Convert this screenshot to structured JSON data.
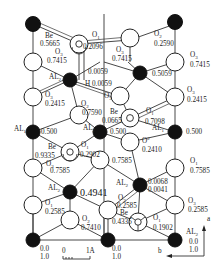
{
  "diagram": {
    "atoms": [
      {
        "id": "al-top-left",
        "type": "Al",
        "label": "",
        "height": "",
        "x": 33,
        "y": 24
      },
      {
        "id": "al-top-right",
        "type": "Al",
        "label": "",
        "height": "",
        "x": 175,
        "y": 24
      },
      {
        "id": "be-top",
        "type": "Be",
        "label": "Be",
        "height": "0.5665",
        "x": 79,
        "y": 44
      },
      {
        "id": "o1-top",
        "type": "O",
        "label": "O",
        "sub": "1",
        "height": "0.2096",
        "x": 79,
        "y": 44
      },
      {
        "id": "o3-top-left",
        "type": "O",
        "label": "O",
        "sub": "3",
        "height": "0.7415",
        "x": 33,
        "y": 62
      },
      {
        "id": "o2-top",
        "type": "O",
        "label": "O",
        "sub": "2",
        "height": "0.2590",
        "x": 130,
        "y": 40
      },
      {
        "id": "o3-top-mid",
        "type": "O",
        "label": "O",
        "sub": "3",
        "height": "0.7415",
        "x": 128,
        "y": 62
      },
      {
        "id": "o3-top-right",
        "type": "O",
        "label": "O",
        "sub": "3",
        "height": "0.7415",
        "x": 175,
        "y": 62
      },
      {
        "id": "al2-upper",
        "type": "Al",
        "label": "AL",
        "sub": "2",
        "height": "",
        "x": 70,
        "y": 80
      },
      {
        "id": "h-upper",
        "type": "H",
        "label": "H",
        "height": "0.0059",
        "x": 70,
        "y": 80
      },
      {
        "id": "al-upper-mid",
        "type": "Al",
        "label": "",
        "height": "0.5059",
        "x": 140,
        "y": 73
      },
      {
        "id": "o3-mid-left",
        "type": "O",
        "label": "O",
        "sub": "3",
        "height": "0.2415",
        "x": 33,
        "y": 97
      },
      {
        "id": "o2-mid",
        "type": "O",
        "label": "O",
        "sub": "2",
        "height": "0.7590",
        "x": 79,
        "y": 115
      },
      {
        "id": "o3-mid-right",
        "type": "O",
        "label": "O",
        "sub": "3",
        "height": "0.2415",
        "x": 175,
        "y": 97
      },
      {
        "id": "o3-center",
        "type": "O",
        "label": "O",
        "sub": "3",
        "height": "",
        "x": 120,
        "y": 96
      },
      {
        "id": "be-mid",
        "type": "Be",
        "label": "Be",
        "height": "0.0665",
        "x": 130,
        "y": 118
      },
      {
        "id": "o1-mid",
        "type": "O",
        "label": "O",
        "sub": "1",
        "height": "0.7098",
        "x": 130,
        "y": 118
      },
      {
        "id": "al-left-mid",
        "type": "Al",
        "label": "AL",
        "sub": "1",
        "height": "0.500",
        "x": 33,
        "y": 132
      },
      {
        "id": "al3-center",
        "type": "Al",
        "label": "AL",
        "sub": "3",
        "height": "0.500",
        "x": 100,
        "y": 132
      },
      {
        "id": "al1-right",
        "type": "Al",
        "label": "AL",
        "sub": "1",
        "height": "0.500",
        "x": 175,
        "y": 132
      },
      {
        "id": "be-lower",
        "type": "Be",
        "label": "Be",
        "height": "0.9335",
        "x": 70,
        "y": 152
      },
      {
        "id": "o1-lower",
        "type": "O",
        "label": "O",
        "sub": "1",
        "height": "0.2902",
        "x": 70,
        "y": 152
      },
      {
        "id": "o2-lower-center",
        "type": "O",
        "label": "O",
        "sub": "2",
        "height": "0.2410",
        "x": 130,
        "y": 142
      },
      {
        "id": "o3-lower-left",
        "type": "O",
        "label": "O",
        "sub": "3",
        "height": "0.7585",
        "x": 33,
        "y": 168
      },
      {
        "id": "o-lower-mid",
        "type": "O",
        "label": "",
        "height": "0.7585",
        "x": 100,
        "y": 160
      },
      {
        "id": "o3-lower-right",
        "type": "O",
        "label": "O",
        "sub": "3",
        "height": "0.7585",
        "x": 175,
        "y": 168
      },
      {
        "id": "al2-lower-left",
        "type": "Al",
        "label": "AL",
        "sub": "2",
        "height": "0.4941",
        "x": 70,
        "y": 192
      },
      {
        "id": "al2-lower-right",
        "type": "Al",
        "label": "AL",
        "sub": "2",
        "height": "0.0068 / 0.0041",
        "x": 140,
        "y": 185
      },
      {
        "id": "o3-bottom-left",
        "type": "O",
        "label": "O",
        "sub": "3",
        "height": "0.2585",
        "x": 33,
        "y": 205
      },
      {
        "id": "o3-bottom-mid",
        "type": "O",
        "label": "O",
        "sub": "3",
        "height": "0.2585",
        "x": 108,
        "y": 210
      },
      {
        "id": "o3-bottom-right",
        "type": "O",
        "label": "O",
        "sub": "3",
        "height": "0.2585",
        "x": 175,
        "y": 205
      },
      {
        "id": "o2-bottom",
        "type": "O",
        "label": "O",
        "sub": "2",
        "height": "0.7410",
        "x": 70,
        "y": 220
      },
      {
        "id": "be-bottom",
        "type": "Be",
        "label": "Be",
        "height": "0.4335",
        "x": 138,
        "y": 222
      },
      {
        "id": "o1-bottom",
        "type": "O",
        "label": "O",
        "sub": "1",
        "height": "0.1902",
        "x": 138,
        "y": 222
      },
      {
        "id": "al-bottom-left",
        "type": "Al",
        "label": "",
        "height": "0.0 / 1.0",
        "x": 33,
        "y": 240
      },
      {
        "id": "al-bottom-mid",
        "type": "Al",
        "label": "",
        "height": "",
        "x": 108,
        "y": 240
      },
      {
        "id": "al2-bottom-right",
        "type": "Al",
        "label": "AL",
        "sub": "2",
        "height": "0.0 / 1.0",
        "x": 175,
        "y": 240
      }
    ],
    "labels": {
      "be_top": "Be",
      "be_top_h": "0.5665",
      "o1_top": "O",
      "o1_top_sub": "1",
      "o1_top_h": "0.2096",
      "o3_tl": "O",
      "o3_tl_sub": "3",
      "o3_tl_h": "0.7415",
      "o2_top": "O",
      "o2_top_sub": "2",
      "o2_top_h": "0.2590",
      "o3_tm": "O",
      "o3_tm_sub": "3",
      "o3_tm_h": "0.7415",
      "o3_tr": "O",
      "o3_tr_sub": "3",
      "o3_tr_h": "0.7415",
      "al2_u": "AL",
      "al2_u_sub": "2",
      "al2_u_h1": "0.0059",
      "h_u": "H 0.0059",
      "al_um_h": "0.5059",
      "o3_ml": "O",
      "o3_ml_sub": "3",
      "o3_ml_h": "0.2415",
      "o2_m": "O",
      "o2_m_sub": "2",
      "o2_m_h": "0.7590",
      "o3_mr": "O",
      "o3_mr_sub": "3",
      "o3_mr_h": "0.2415",
      "o3_c": "O",
      "o3_c_sub": "3",
      "be_m": "Be",
      "be_m_h": "0.0665",
      "o1_m": "O",
      "o1_m_sub": "1",
      "o1_m_h": "0.7098",
      "al_lm": "AL",
      "al_lm_sub": "1",
      "al_lm_h": "0.500",
      "al3_c": "AL",
      "al3_c_sub": "3",
      "al3_c_h": "0.500",
      "al1_r": "AL",
      "al1_r_sub": "1",
      "al1_r_h": "0.500",
      "be_l": "Be",
      "be_l_h": "0.9335",
      "o1_l": "O",
      "o1_l_sub": "1",
      "o1_l_h": "0.2902",
      "o2_lc": "O",
      "o2_lc_sup": "2",
      "o2_lc_h": "0.2410",
      "o3_ll": "O",
      "o3_ll_sub": "3",
      "o3_ll_h": "0.7585",
      "o_lm_h": "0.7585",
      "o3_lr": "O",
      "o3_lr_sub": "1",
      "o3_lr_h": "0.7585",
      "al2_ll": "AL",
      "al2_ll_sub": "2",
      "al2_ll_h": "0.4941",
      "al2_lr": "AL",
      "al2_lr_sub": "2",
      "al2_lr_h1": "0.0068",
      "al2_lr_h2": "0.0041",
      "o3_bl": "O",
      "o3_bl_sub": "1",
      "o3_bl_h": "0.2585",
      "o3_bm": "O",
      "o3_bm_sub": "3",
      "o3_bm_h": "0.2585",
      "o3_br": "O",
      "o3_br_sub": "3",
      "o3_br_h": "0.2585",
      "o2_b": "O",
      "o2_b_sub": "2",
      "o2_b_h": "0.7410",
      "be_b": "Be",
      "be_b_h": "0.4335",
      "o1_b": "O",
      "o1_b_sub": "1",
      "o1_b_h": "0.1902",
      "corner_bl_h1": "0.0",
      "corner_bl_h2": "1.0",
      "corner_bm_h1": "0.0",
      "corner_bm_h2": "1.0",
      "al2_br": "AL",
      "al2_br_sub": "2",
      "al2_br_h1": "0.0",
      "al2_br_h2": "1.0"
    },
    "scale_bar": {
      "start": "0",
      "end": "1A"
    },
    "axes": {
      "vertical": "a",
      "horizontal": "b"
    }
  }
}
